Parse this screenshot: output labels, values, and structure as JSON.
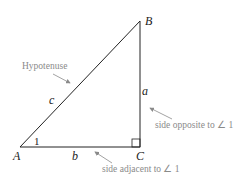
{
  "diagram": {
    "vertices": {
      "A": "A",
      "B": "B",
      "C": "C"
    },
    "sides": {
      "a": "a",
      "b": "b",
      "c": "c"
    },
    "angle_label": "1",
    "annotations": {
      "hypotenuse": "Hypotenuse",
      "opposite": "side opposite to ∠ 1",
      "adjacent": "side adjacent to ∠ 1"
    },
    "colors": {
      "line": "#222222",
      "annotation": "#8a8a8a"
    }
  }
}
